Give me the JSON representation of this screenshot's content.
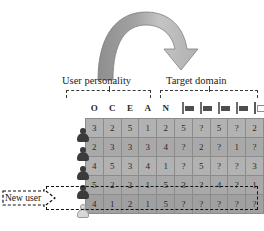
{
  "figure": {
    "arrow_icon": "curved-arrow-icon",
    "new_user_label": "New user",
    "new_user_callout_icon": "dashed-arrow-callout-icon"
  },
  "groups": {
    "personality": {
      "caption": "User personality",
      "bracket_icon": "dashed-bracket-icon"
    },
    "domain": {
      "caption": "Target domain",
      "bracket_icon": "dashed-bracket-icon"
    }
  },
  "chart_data": {
    "type": "table",
    "column_groups": [
      "User personality",
      "Target domain"
    ],
    "personality_headers": [
      "O",
      "C",
      "E",
      "A",
      "N"
    ],
    "domain_headers": [
      "domain-icon-1",
      "domain-icon-2",
      "domain-icon-3",
      "domain-icon-4",
      "domain-icon-5"
    ],
    "row_labels": [
      "user-1",
      "user-2",
      "user-3",
      "user-4",
      "new-user"
    ],
    "rows": [
      {
        "label": "user-1",
        "new_user": false,
        "personality": [
          "3",
          "2",
          "5",
          "1",
          "2"
        ],
        "domain": [
          "5",
          "?",
          "5",
          "?",
          "2"
        ]
      },
      {
        "label": "user-2",
        "new_user": false,
        "personality": [
          "2",
          "3",
          "3",
          "3",
          "4"
        ],
        "domain": [
          "?",
          "2",
          "?",
          "1",
          "?"
        ]
      },
      {
        "label": "user-3",
        "new_user": false,
        "personality": [
          "4",
          "5",
          "3",
          "4",
          "1"
        ],
        "domain": [
          "?",
          "5",
          "?",
          "?",
          "3"
        ]
      },
      {
        "label": "user-4",
        "new_user": false,
        "personality": [
          "5",
          "2",
          "2",
          "1",
          "5"
        ],
        "domain": [
          "3",
          "?",
          "4",
          "?",
          "1"
        ]
      },
      {
        "label": "new-user",
        "new_user": true,
        "personality": [
          "4",
          "1",
          "2",
          "1",
          "5"
        ],
        "domain": [
          "?",
          "?",
          "?",
          "?",
          "?"
        ]
      }
    ],
    "missing_value_token": "?",
    "rating_scale": [
      1,
      5
    ]
  },
  "colors": {
    "cell_fill": "#b2b2b2",
    "cell_fill_alt": "#a9a9a9",
    "new_row_fill": "#a0a0a0",
    "cell_border": "#8b8b8b",
    "arrow_fill": "#a6a6a6",
    "text": "#2a2a2a",
    "header_letter": "#4a4a4a"
  }
}
